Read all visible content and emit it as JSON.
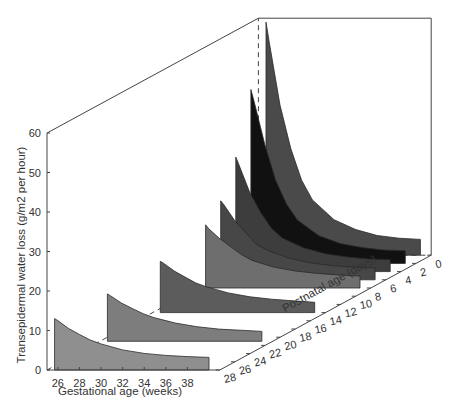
{
  "chart_data": {
    "type": "area",
    "subtype": "3d-waterfall",
    "title": "",
    "xlabel": "Gestational age (weeks)",
    "ylabel": "Postnatal age (days)",
    "zlabel": "Transepidermal water loss (g/m2 per hour)",
    "x_ticks": [
      26,
      28,
      30,
      32,
      34,
      36,
      38
    ],
    "y_ticks": [
      0,
      2,
      4,
      6,
      8,
      10,
      12,
      14,
      16,
      18,
      20,
      22,
      24,
      26,
      28
    ],
    "z_ticks": [
      0,
      10,
      20,
      30,
      40,
      50,
      60
    ],
    "xlim": [
      25,
      41
    ],
    "ylim": [
      0,
      28
    ],
    "zlim": [
      0,
      60
    ],
    "grid": false,
    "legend": null,
    "series": [
      {
        "name": "Postnatal day 0",
        "postnatal_age_days": 0,
        "x": [
          25.7,
          26,
          27,
          28,
          29,
          30,
          32,
          34,
          36,
          38,
          40
        ],
        "values": [
          59,
          54,
          38,
          27,
          19,
          14,
          9,
          6.5,
          5,
          4.3,
          4
        ],
        "color": "#4a4a4a"
      },
      {
        "name": "Postnatal day 2",
        "postnatal_age_days": 2,
        "x": [
          25.7,
          26,
          27,
          28,
          29,
          30,
          32,
          34,
          36,
          38,
          40
        ],
        "values": [
          44,
          41,
          30,
          21,
          15,
          11,
          7,
          5,
          4,
          3.4,
          3.2
        ],
        "color": "#111111"
      },
      {
        "name": "Postnatal day 4",
        "postnatal_age_days": 4,
        "x": [
          25.7,
          26,
          27,
          28,
          29,
          30,
          32,
          34,
          36,
          38,
          40
        ],
        "values": [
          29,
          27,
          20,
          15,
          11,
          8.5,
          6,
          4.5,
          3.7,
          3.2,
          3
        ],
        "color": "#3d3d3d"
      },
      {
        "name": "Postnatal day 6",
        "postnatal_age_days": 6,
        "x": [
          25.7,
          26,
          27,
          28,
          29,
          30,
          32,
          34,
          36,
          38,
          40
        ],
        "values": [
          20,
          19,
          15,
          12,
          9,
          7.5,
          5.5,
          4.3,
          3.6,
          3.2,
          3
        ],
        "color": "#474747"
      },
      {
        "name": "Postnatal day 8",
        "postnatal_age_days": 8,
        "x": [
          25.7,
          26,
          27,
          28,
          29,
          30,
          32,
          34,
          36,
          38,
          40
        ],
        "values": [
          16,
          15,
          12.5,
          10.5,
          8.5,
          7,
          5.3,
          4.3,
          3.7,
          3.3,
          3
        ],
        "color": "#6e6e6e"
      },
      {
        "name": "Postnatal day 14",
        "postnatal_age_days": 14,
        "x": [
          25.7,
          26,
          27,
          28,
          29,
          30,
          32,
          34,
          36,
          38,
          40
        ],
        "values": [
          13,
          12.5,
          10.5,
          9,
          7.5,
          6.5,
          5,
          4,
          3.4,
          3,
          2.6
        ],
        "color": "#5c5c5c"
      },
      {
        "name": "Postnatal day 21",
        "postnatal_age_days": 21,
        "x": [
          25.7,
          26,
          27,
          28,
          29,
          30,
          32,
          34,
          36,
          38,
          40
        ],
        "values": [
          12,
          11.5,
          9.7,
          8.3,
          7,
          6,
          4.6,
          3.7,
          3.1,
          2.8,
          2.5
        ],
        "color": "#7d7d7d"
      },
      {
        "name": "Postnatal day 28",
        "postnatal_age_days": 28,
        "x": [
          25.7,
          26,
          27,
          28,
          29,
          30,
          32,
          34,
          36,
          38,
          40
        ],
        "values": [
          13,
          12.5,
          10.5,
          9,
          7.6,
          6.6,
          5.1,
          4.2,
          3.7,
          3.4,
          3.2
        ],
        "color": "#8f8f8f"
      }
    ]
  }
}
